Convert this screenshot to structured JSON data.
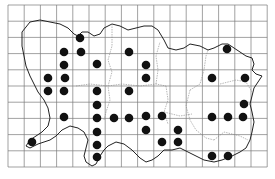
{
  "map": {
    "title": "",
    "grid": {
      "x0": 8,
      "y0": 5,
      "cell": 16.2,
      "cols": 16,
      "rows": 10,
      "color": "#7a7a7a"
    },
    "coast_color": "#222222",
    "boundary_color": "#888888",
    "dot_color": "#111111",
    "dots": [
      [
        80,
        38
      ],
      [
        64,
        52
      ],
      [
        81,
        52
      ],
      [
        97,
        64
      ],
      [
        64,
        65
      ],
      [
        48,
        78
      ],
      [
        65,
        78
      ],
      [
        129,
        52
      ],
      [
        146,
        65
      ],
      [
        146,
        78
      ],
      [
        227,
        49
      ],
      [
        212,
        78
      ],
      [
        245,
        78
      ],
      [
        244,
        104
      ],
      [
        243,
        117
      ],
      [
        48,
        91
      ],
      [
        64,
        91
      ],
      [
        97,
        91
      ],
      [
        129,
        91
      ],
      [
        97,
        105
      ],
      [
        64,
        117
      ],
      [
        97,
        118
      ],
      [
        114,
        118
      ],
      [
        129,
        118
      ],
      [
        97,
        132
      ],
      [
        97,
        145
      ],
      [
        97,
        157
      ],
      [
        32,
        142
      ],
      [
        146,
        116
      ],
      [
        162,
        116
      ],
      [
        146,
        130
      ],
      [
        178,
        130
      ],
      [
        162,
        142
      ],
      [
        178,
        142
      ],
      [
        212,
        117
      ],
      [
        228,
        117
      ],
      [
        212,
        156
      ],
      [
        228,
        156
      ]
    ]
  }
}
